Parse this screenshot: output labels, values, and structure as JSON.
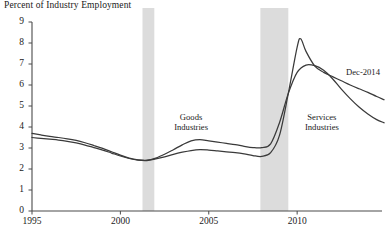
{
  "chart_data": {
    "type": "line",
    "title": "Percent of Industry Employment",
    "xlabel": "",
    "ylabel": "Percent of Industry Employment",
    "xlim": [
      1995,
      2014.8
    ],
    "ylim": [
      0,
      9
    ],
    "grid": false,
    "legend_position": "inline-annotations",
    "xticks": [
      "1995",
      "2000",
      "2005",
      "2010"
    ],
    "xtick_values": [
      1995,
      2000,
      2005,
      2010
    ],
    "yticks": [
      "0",
      "1",
      "2",
      "3",
      "4",
      "5",
      "6",
      "7",
      "8",
      "9"
    ],
    "ytick_values": [
      0,
      1,
      2,
      3,
      4,
      5,
      6,
      7,
      8,
      9
    ],
    "annotations": [
      {
        "text": "Goods Industries",
        "x": 2004.0,
        "y": 4.45
      },
      {
        "text": "Services Industries",
        "x": 2011.4,
        "y": 4.45
      },
      {
        "text": "Dec-2014",
        "x": 2013.9,
        "y": 6.55
      }
    ],
    "shaded_regions": [
      {
        "label": "recession",
        "x0": 2001.25,
        "x1": 2001.92,
        "color": "#dcdcdc"
      },
      {
        "label": "recession",
        "x0": 2007.92,
        "x1": 2009.5,
        "color": "#dcdcdc"
      }
    ],
    "series": [
      {
        "name": "Goods Industries",
        "color": "#3a3a3a",
        "x": [
          1995.0,
          1995.5,
          1996.0,
          1996.5,
          1997.0,
          1997.5,
          1998.0,
          1998.5,
          1999.0,
          1999.5,
          2000.0,
          2000.5,
          2001.0,
          2001.5,
          2002.0,
          2002.5,
          2003.0,
          2003.5,
          2004.0,
          2004.5,
          2005.0,
          2005.5,
          2006.0,
          2006.5,
          2007.0,
          2007.5,
          2008.0,
          2008.5,
          2009.0,
          2009.5,
          2010.0,
          2010.5,
          2011.0,
          2011.5,
          2012.0,
          2012.5,
          2013.0,
          2013.5,
          2014.0,
          2014.5,
          2014.92
        ],
        "y": [
          3.7,
          3.62,
          3.55,
          3.5,
          3.44,
          3.36,
          3.25,
          3.12,
          2.98,
          2.82,
          2.66,
          2.52,
          2.44,
          2.42,
          2.52,
          2.7,
          2.92,
          3.15,
          3.34,
          3.4,
          3.34,
          3.28,
          3.22,
          3.16,
          3.08,
          3.02,
          3.02,
          3.2,
          4.2,
          5.6,
          6.6,
          6.95,
          6.92,
          6.7,
          6.3,
          5.8,
          5.35,
          4.95,
          4.62,
          4.35,
          4.2
        ]
      },
      {
        "name": "Services Industries",
        "color": "#3a3a3a",
        "x": [
          1995.0,
          1995.5,
          1996.0,
          1996.5,
          1997.0,
          1997.5,
          1998.0,
          1998.5,
          1999.0,
          1999.5,
          2000.0,
          2000.5,
          2001.0,
          2001.5,
          2002.0,
          2002.5,
          2003.0,
          2003.5,
          2004.0,
          2004.5,
          2005.0,
          2005.5,
          2006.0,
          2006.5,
          2007.0,
          2007.5,
          2008.0,
          2008.5,
          2009.0,
          2009.5,
          2010.0,
          2010.2,
          2010.5,
          2011.0,
          2011.5,
          2012.0,
          2012.5,
          2013.0,
          2013.5,
          2014.0,
          2014.5,
          2014.92
        ],
        "y": [
          3.5,
          3.46,
          3.42,
          3.38,
          3.32,
          3.24,
          3.14,
          3.02,
          2.9,
          2.76,
          2.62,
          2.5,
          2.42,
          2.4,
          2.48,
          2.58,
          2.7,
          2.8,
          2.88,
          2.92,
          2.9,
          2.86,
          2.82,
          2.78,
          2.72,
          2.64,
          2.6,
          2.78,
          3.6,
          5.6,
          7.8,
          8.2,
          7.6,
          6.9,
          6.6,
          6.4,
          6.2,
          6.0,
          5.82,
          5.65,
          5.45,
          5.3
        ]
      }
    ]
  }
}
